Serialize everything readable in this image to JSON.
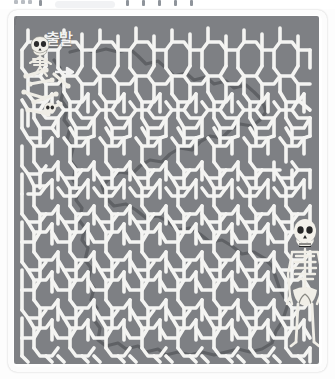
{
  "app": {
    "toolbar_visible": true,
    "toolbar_note": "cut-off application toolbar strip"
  },
  "puzzle": {
    "title": "",
    "start_label": "출발",
    "start_label_romanized": "chulbal",
    "start_label_meaning": "START",
    "type": "hexagonal-maze",
    "grid": {
      "columns": 13,
      "rows": 15,
      "hex_width": 22,
      "hex_height": 24
    },
    "solution_path_visible": true
  },
  "figures": [
    {
      "name": "start-skeleton",
      "label": "skeleton-at-start",
      "position": "top-left"
    },
    {
      "name": "scattered-bones",
      "label": "bone-pile",
      "position": "left"
    },
    {
      "name": "goal-skeleton",
      "label": "standing-skeleton",
      "position": "bottom-right"
    }
  ],
  "colors": {
    "plate": "#7e8084",
    "wall": "#f4f4f2",
    "solution": "#5d5f63",
    "frame": "#ffffff",
    "bone": "#f0efe9",
    "page": "#fdfdfd"
  },
  "icons": {
    "start_arrow": "arrow-right-icon",
    "skull": "skull-icon"
  }
}
